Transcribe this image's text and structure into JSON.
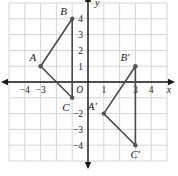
{
  "figure": {
    "background_color": "#ffffff",
    "grid_color": "#d4d4d4",
    "axis_color": "#1a1a1a",
    "shape_color": "#4a4a4a",
    "point_color": "#555555"
  },
  "chart_data": {
    "type": "scatter",
    "title": "",
    "xlabel": "x",
    "ylabel": "y",
    "xlim": [
      -5,
      5
    ],
    "ylim": [
      -5,
      5
    ],
    "grid": true,
    "legend": "none",
    "origin_label": "O",
    "x_ticks": [
      {
        "value": -4,
        "label": "−4"
      },
      {
        "value": -3,
        "label": "−3"
      },
      {
        "value": 1,
        "label": "1"
      },
      {
        "value": 3,
        "label": "3"
      },
      {
        "value": 4,
        "label": "4"
      }
    ],
    "y_ticks": [
      {
        "value": 4,
        "label": "4"
      },
      {
        "value": 3,
        "label": "3"
      },
      {
        "value": 2,
        "label": "2"
      },
      {
        "value": 1,
        "label": "1"
      },
      {
        "value": -2,
        "label": "−2"
      },
      {
        "value": -3,
        "label": "−3"
      },
      {
        "value": -4,
        "label": "−4"
      }
    ],
    "series": [
      {
        "name": "Triangle ABC",
        "closed": true,
        "points": [
          {
            "label": "A",
            "x": -3,
            "y": 1,
            "label_dx": -11,
            "label_dy": -5
          },
          {
            "label": "B",
            "x": -1,
            "y": 4,
            "label_dx": -12,
            "label_dy": -4
          },
          {
            "label": "C",
            "x": -1,
            "y": -1,
            "label_dx": -10,
            "label_dy": 13
          }
        ]
      },
      {
        "name": "Triangle A'B'C'",
        "closed": true,
        "points": [
          {
            "label": "A′",
            "x": 1,
            "y": -2,
            "label_dx": -16,
            "label_dy": -4
          },
          {
            "label": "B′",
            "x": 3,
            "y": 1,
            "label_dx": -15,
            "label_dy": -5
          },
          {
            "label": "C′",
            "x": 3,
            "y": -4,
            "label_dx": -5,
            "label_dy": 13
          }
        ]
      }
    ]
  }
}
